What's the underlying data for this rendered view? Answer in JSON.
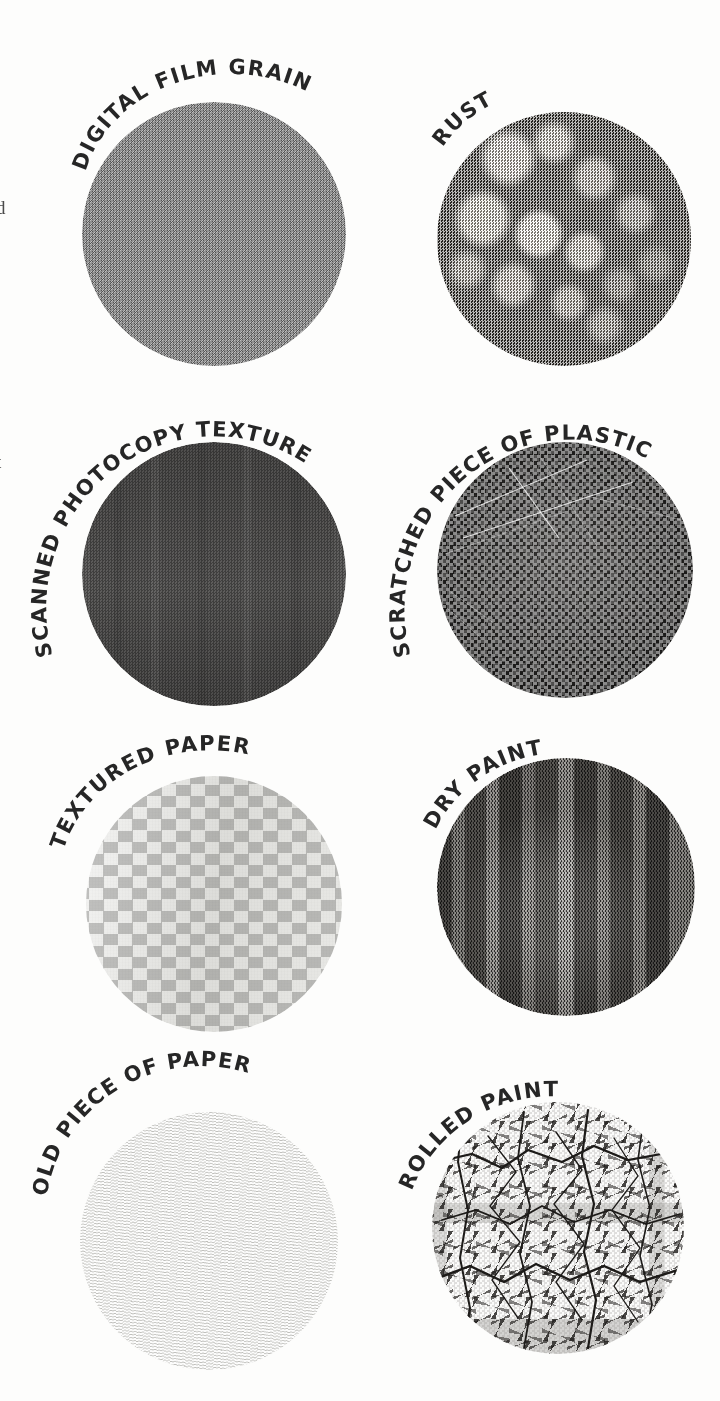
{
  "page": {
    "background_color": "#fdfdfc",
    "ink_color": "#262626",
    "width": 720,
    "height": 1401,
    "margin_text_fragments": [
      {
        "glyph": "d",
        "top": 198
      },
      {
        "glyph": "t",
        "top": 452
      }
    ]
  },
  "samples": [
    {
      "id": "digital-film-grain",
      "label": "DIGITAL FILM GRAIN",
      "column": "left",
      "row": 1,
      "circle": {
        "left": 82,
        "top": 102,
        "size": 264
      },
      "base_color": "#8d8d8d",
      "label_arc": {
        "x": 86,
        "y": 100,
        "w": 270,
        "h": 150,
        "start_angle": -58,
        "sweep": 62
      }
    },
    {
      "id": "rust",
      "label": "RUST",
      "column": "right",
      "row": 1,
      "circle": {
        "left": 437,
        "top": 112,
        "size": 254
      },
      "base_color": "#4c4a47",
      "label_arc": {
        "x": 441,
        "y": 110,
        "w": 260,
        "h": 150,
        "start_angle": -54,
        "sweep": 20
      }
    },
    {
      "id": "scanned-photocopy-texture",
      "label": "SCANNED PHOTOCOPY TEXTURE",
      "column": "left",
      "row": 2,
      "circle": {
        "left": 82,
        "top": 442,
        "size": 264
      },
      "base_color": "#4e4d4c",
      "label_arc": {
        "x": 86,
        "y": 440,
        "w": 270,
        "h": 150,
        "start_angle": -106,
        "sweep": 112
      }
    },
    {
      "id": "scratched-piece-of-plastic",
      "label": "SCRATCHED PIECE OF PLASTIC",
      "column": "right",
      "row": 2,
      "circle": {
        "left": 437,
        "top": 442,
        "size": 256
      },
      "base_color": "#1c1b1a",
      "label_arc": {
        "x": 441,
        "y": 440,
        "w": 262,
        "h": 150,
        "start_angle": -108,
        "sweep": 114
      }
    },
    {
      "id": "textured-paper",
      "label": "TEXTURED PAPER",
      "column": "left",
      "row": 3,
      "circle": {
        "left": 86,
        "top": 776,
        "size": 256
      },
      "base_color": "#e4e4e1",
      "label_arc": {
        "x": 90,
        "y": 774,
        "w": 262,
        "h": 150,
        "start_angle": -68,
        "sweep": 58
      }
    },
    {
      "id": "dry-paint",
      "label": "DRY PAINT",
      "column": "right",
      "row": 3,
      "circle": {
        "left": 437,
        "top": 758,
        "size": 258
      },
      "base_color": "#4a4845",
      "label_arc": {
        "x": 441,
        "y": 756,
        "w": 264,
        "h": 150,
        "start_angle": -62,
        "sweep": 34
      }
    },
    {
      "id": "old-piece-of-paper",
      "label": "OLD PIECE OF PAPER",
      "column": "left",
      "row": 4,
      "circle": {
        "left": 80,
        "top": 1112,
        "size": 258
      },
      "base_color": "#f1f1ef",
      "label_arc": {
        "x": 84,
        "y": 1110,
        "w": 264,
        "h": 150,
        "start_angle": -78,
        "sweep": 72
      }
    },
    {
      "id": "rolled-paint",
      "label": "ROLLED PAINT",
      "column": "right",
      "row": 4,
      "circle": {
        "left": 432,
        "top": 1102,
        "size": 252
      },
      "base_color": "#fbfbfa",
      "label_arc": {
        "x": 436,
        "y": 1100,
        "w": 258,
        "h": 150,
        "start_angle": -74,
        "sweep": 48
      }
    }
  ]
}
